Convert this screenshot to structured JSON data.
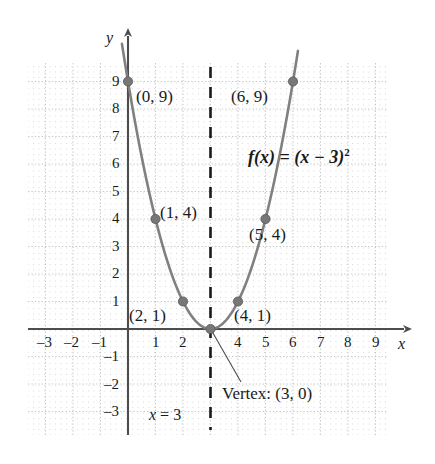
{
  "chart_data": {
    "type": "line",
    "title": "",
    "subtitle": "",
    "xlabel": "x",
    "ylabel": "y",
    "xlim": [
      -3.6,
      10.0
    ],
    "ylim": [
      -3.6,
      10.2
    ],
    "grid": true,
    "legend": false,
    "function_label": "f(x) = (x − 3)²",
    "function_label_base": "f(x) = (x − 3)",
    "function_label_exponent": "2",
    "curve_expression": "(x-3)^2",
    "curve_color": "#808080",
    "x_ticks": [
      -3,
      -2,
      -1,
      1,
      2,
      4,
      5,
      6,
      7,
      8,
      9
    ],
    "x_tick_labels": [
      "–3",
      "–2",
      "–1",
      "1",
      "2",
      "4",
      "5",
      "6",
      "7",
      "8",
      "9"
    ],
    "y_ticks": [
      9,
      8,
      7,
      6,
      5,
      4,
      3,
      2,
      1,
      -1,
      -2,
      -3
    ],
    "y_tick_labels": [
      "9",
      "8",
      "7",
      "6",
      "5",
      "4",
      "3",
      "2",
      "1",
      "–1",
      "–2",
      "–3"
    ],
    "series": [
      {
        "name": "f(x) = (x - 3)^2",
        "x": [
          0,
          1,
          2,
          3,
          4,
          5,
          6
        ],
        "values": [
          9,
          4,
          1,
          0,
          1,
          4,
          9
        ]
      }
    ],
    "points": [
      {
        "x": 0,
        "y": 9,
        "label": "(0, 9)"
      },
      {
        "x": 1,
        "y": 4,
        "label": "(1, 4)"
      },
      {
        "x": 2,
        "y": 1,
        "label": "(2, 1)"
      },
      {
        "x": 3,
        "y": 0,
        "label": "Vertex: (3, 0)"
      },
      {
        "x": 4,
        "y": 1,
        "label": "(4, 1)"
      },
      {
        "x": 5,
        "y": 4,
        "label": "(5, 4)"
      },
      {
        "x": 6,
        "y": 9,
        "label": "(6, 9)"
      }
    ],
    "annotations": [
      {
        "name": "axis-of-symmetry",
        "text": "x = 3",
        "type": "dashed-vertical-line",
        "x": 3
      },
      {
        "name": "vertex-callout",
        "text": "Vertex: (3, 0)",
        "type": "leader-line"
      }
    ]
  },
  "axis": {
    "x_label": "x",
    "y_label": "y"
  },
  "point_labels": {
    "p0_9": "(0, 9)",
    "p6_9": "(6, 9)",
    "p1_4": "(1, 4)",
    "p5_4": "(5, 4)",
    "p2_1": "(2, 1)",
    "p4_1": "(4, 1)"
  },
  "notes": {
    "vertex": "Vertex: (3, 0)",
    "axis_of_symmetry_var": "x",
    "axis_of_symmetry_rest": " = 3"
  },
  "formula": {
    "base": "f(x) = (x − 3)",
    "exponent": "2"
  },
  "ticks": {
    "x": [
      "–3",
      "–2",
      "–1",
      "1",
      "2",
      "4",
      "5",
      "6",
      "7",
      "8",
      "9"
    ],
    "y": [
      "9",
      "8",
      "7",
      "6",
      "5",
      "4",
      "3",
      "2",
      "1",
      "–1",
      "–2",
      "–3"
    ]
  },
  "colors": {
    "curve": "#808080",
    "axis": "#4d4d4d",
    "grid": "#c8c8c8",
    "text": "#1a1a1a",
    "point": "#777777"
  }
}
